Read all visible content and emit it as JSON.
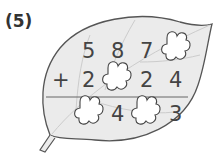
{
  "problem_label": "(5)",
  "operator": "+",
  "rows": {
    "top": [
      "5",
      "8",
      "7",
      "blank"
    ],
    "second": [
      "2",
      "blank",
      "2",
      "4"
    ],
    "result": [
      "blank",
      "4",
      "blank",
      "3"
    ]
  },
  "digits": {
    "r1c1": "5",
    "r1c2": "8",
    "r1c3": "7",
    "r2c1": "2",
    "r2c3": "2",
    "r2c4": "4",
    "r3c2": "4",
    "r3c4": "3"
  },
  "colors": {
    "leaf_fill": "#ebebeb",
    "leaf_stroke": "#555555",
    "blank_fill": "#ffffff",
    "text": "#444444"
  }
}
